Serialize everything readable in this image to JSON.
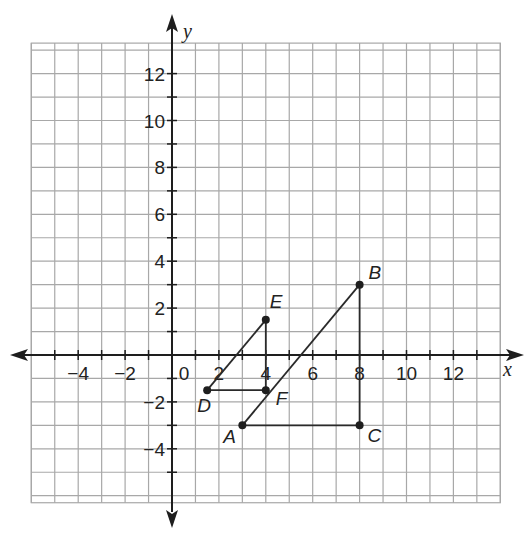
{
  "chart_data": {
    "type": "scatter",
    "title": "",
    "xlabel": "x",
    "ylabel": "y",
    "xlim": [
      -6,
      14
    ],
    "ylim": [
      -6.3,
      13.3
    ],
    "grid": true,
    "x_ticks": [
      -4,
      -2,
      0,
      2,
      4,
      6,
      8,
      10,
      12
    ],
    "x_tick_labels": [
      "−4",
      "−2",
      "0",
      "2",
      "4",
      "6",
      "8",
      "10",
      "12"
    ],
    "y_ticks": [
      -4,
      -2,
      2,
      4,
      6,
      8,
      10,
      12
    ],
    "y_tick_labels": [
      "−4",
      "−2",
      "2",
      "4",
      "6",
      "8",
      "10",
      "12"
    ],
    "points": [
      {
        "name": "A",
        "x": 3,
        "y": -3
      },
      {
        "name": "B",
        "x": 8,
        "y": 3
      },
      {
        "name": "C",
        "x": 8,
        "y": -3
      },
      {
        "name": "D",
        "x": 1.5,
        "y": -1.5
      },
      {
        "name": "E",
        "x": 4,
        "y": 1.5
      },
      {
        "name": "F",
        "x": 4,
        "y": -1.5
      }
    ],
    "segments": [
      {
        "from": "A",
        "to": "B"
      },
      {
        "from": "B",
        "to": "C"
      },
      {
        "from": "A",
        "to": "C"
      },
      {
        "from": "D",
        "to": "E"
      },
      {
        "from": "E",
        "to": "F"
      },
      {
        "from": "D",
        "to": "F"
      }
    ],
    "triangles": [
      {
        "name": "ABC",
        "vertices": [
          "A",
          "B",
          "C"
        ]
      },
      {
        "name": "DEF",
        "vertices": [
          "D",
          "E",
          "F"
        ]
      }
    ]
  },
  "colors": {
    "grid": "#a8a8a8",
    "axis": "#1e1e1e",
    "segment": "#2a2a2a",
    "point": "#1e1e1e",
    "text": "#222222"
  }
}
